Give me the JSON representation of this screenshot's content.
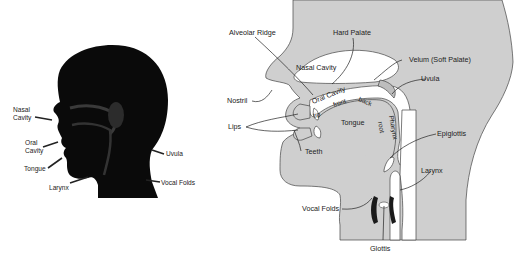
{
  "left_figure": {
    "description": "Dark silhouette of a human head in profile with vocal tract overlay",
    "labels": [
      {
        "id": "nasal_cavity",
        "lines": [
          "Nasal",
          "Cavity"
        ]
      },
      {
        "id": "oral_cavity",
        "lines": [
          "Oral",
          "Cavity"
        ]
      },
      {
        "id": "tongue",
        "text": "Tongue"
      },
      {
        "id": "larynx",
        "text": "Larynx"
      },
      {
        "id": "uvula",
        "text": "Uvula"
      },
      {
        "id": "vocal_folds",
        "text": "Vocal Folds"
      }
    ]
  },
  "right_figure": {
    "description": "Midsagittal cross-section of the human vocal tract",
    "labels": [
      {
        "id": "alveolar_ridge",
        "text": "Alveolar Ridge"
      },
      {
        "id": "hard_palate",
        "text": "Hard Palate"
      },
      {
        "id": "nasal_cavity",
        "text": "Nasal Cavity"
      },
      {
        "id": "velum",
        "text": "Velum (Soft Palate)"
      },
      {
        "id": "uvula",
        "text": "Uvula"
      },
      {
        "id": "nostril",
        "text": "Nostril"
      },
      {
        "id": "oral_cavity",
        "text": "Oral Cavity"
      },
      {
        "id": "tip",
        "text": "tip"
      },
      {
        "id": "front",
        "text": "front"
      },
      {
        "id": "back",
        "text": "back"
      },
      {
        "id": "tongue",
        "text": "Tongue"
      },
      {
        "id": "pharynx",
        "text": "Pharynx"
      },
      {
        "id": "root",
        "text": "root"
      },
      {
        "id": "lips",
        "text": "Lips"
      },
      {
        "id": "teeth",
        "text": "Teeth"
      },
      {
        "id": "epiglottis",
        "text": "Epiglottis"
      },
      {
        "id": "larynx",
        "text": "Larynx"
      },
      {
        "id": "vocal_folds",
        "text": "Vocal Folds"
      },
      {
        "id": "glottis",
        "text": "Glottis"
      }
    ]
  },
  "colors": {
    "silhouette": "#0a0a0a",
    "tissue": "#cfcfcf",
    "cavity": "#ffffff",
    "outline": "#444444"
  }
}
